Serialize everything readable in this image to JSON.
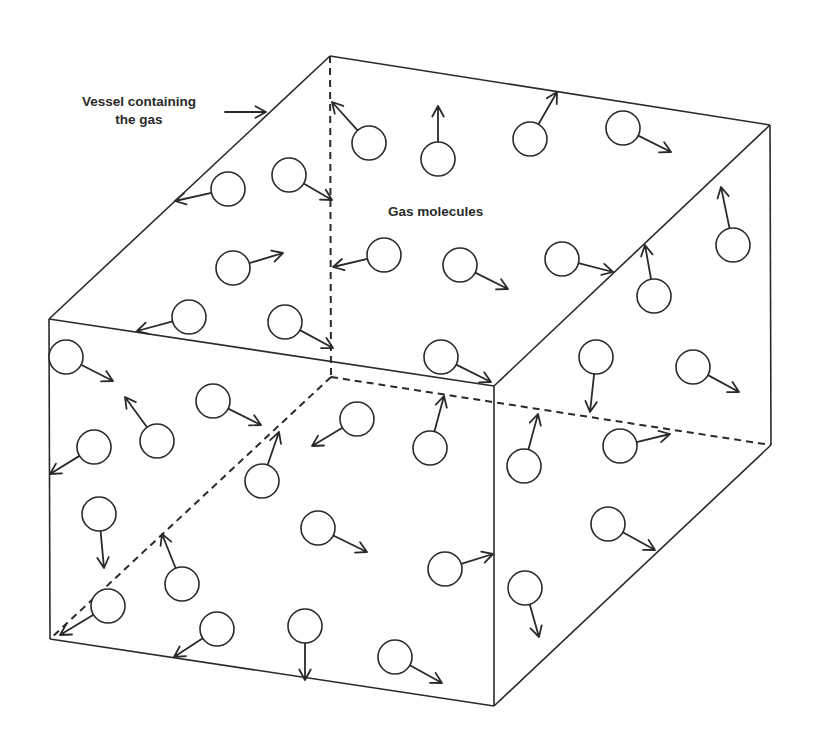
{
  "diagram": {
    "labels": {
      "vessel_line1": "Vessel containing",
      "vessel_line2": "the gas",
      "molecules": "Gas molecules"
    },
    "colors": {
      "stroke": "#2a2a2a",
      "background": "#ffffff"
    },
    "box": {
      "vertices": {
        "top_back_left": [
          330,
          56
        ],
        "top_back_right": [
          770,
          125
        ],
        "top_front_left": [
          49,
          319
        ],
        "top_front_right": [
          494,
          386
        ],
        "bottom_front_left": [
          50,
          639
        ],
        "bottom_front_right": [
          494,
          706
        ],
        "bottom_back_right": [
          771,
          445
        ],
        "bottom_back_left_hidden": [
          331,
          377
        ]
      },
      "visible_edges": [
        [
          "top_back_left",
          "top_back_right"
        ],
        [
          "top_back_left",
          "top_front_left"
        ],
        [
          "top_back_right",
          "top_front_right"
        ],
        [
          "top_front_left",
          "top_front_right"
        ],
        [
          "top_front_left",
          "bottom_front_left"
        ],
        [
          "top_front_right",
          "bottom_front_right"
        ],
        [
          "bottom_front_left",
          "bottom_front_right"
        ],
        [
          "bottom_front_right",
          "bottom_back_right"
        ],
        [
          "top_back_right",
          "bottom_back_right"
        ]
      ],
      "hidden_edges": [
        [
          "top_back_left",
          "bottom_back_left_hidden"
        ],
        [
          "bottom_back_left_hidden",
          "bottom_front_left"
        ],
        [
          "bottom_back_left_hidden",
          "bottom_back_right"
        ]
      ]
    },
    "pointer_arrow": {
      "from": [
        225,
        112
      ],
      "to": [
        266,
        112
      ]
    },
    "molecule_radius": 17,
    "molecules": [
      {
        "c": [
          369,
          143
        ],
        "tip": [
          332,
          102
        ]
      },
      {
        "c": [
          438,
          159
        ],
        "tip": [
          438,
          106
        ]
      },
      {
        "c": [
          530,
          139
        ],
        "tip": [
          557,
          92
        ]
      },
      {
        "c": [
          623,
          128
        ],
        "tip": [
          671,
          152
        ]
      },
      {
        "c": [
          228,
          189
        ],
        "tip": [
          175,
          201
        ]
      },
      {
        "c": [
          289,
          175
        ],
        "tip": [
          332,
          200
        ]
      },
      {
        "c": [
          384,
          255
        ],
        "tip": [
          333,
          267
        ]
      },
      {
        "c": [
          233,
          268
        ],
        "tip": [
          283,
          253
        ]
      },
      {
        "c": [
          460,
          265
        ],
        "tip": [
          508,
          289
        ]
      },
      {
        "c": [
          562,
          259
        ],
        "tip": [
          613,
          272
        ]
      },
      {
        "c": [
          654,
          296
        ],
        "tip": [
          645,
          245
        ]
      },
      {
        "c": [
          733,
          245
        ],
        "tip": [
          721,
          187
        ]
      },
      {
        "c": [
          189,
          317
        ],
        "tip": [
          137,
          331
        ]
      },
      {
        "c": [
          285,
          322
        ],
        "tip": [
          333,
          348
        ]
      },
      {
        "c": [
          441,
          357
        ],
        "tip": [
          491,
          382
        ]
      },
      {
        "c": [
          596,
          357
        ],
        "tip": [
          590,
          412
        ]
      },
      {
        "c": [
          693,
          367
        ],
        "tip": [
          739,
          392
        ]
      },
      {
        "c": [
          66,
          357
        ],
        "tip": [
          113,
          381
        ]
      },
      {
        "c": [
          157,
          441
        ],
        "tip": [
          125,
          397
        ]
      },
      {
        "c": [
          213,
          401
        ],
        "tip": [
          261,
          425
        ]
      },
      {
        "c": [
          94,
          447
        ],
        "tip": [
          50,
          474
        ]
      },
      {
        "c": [
          357,
          419
        ],
        "tip": [
          312,
          446
        ]
      },
      {
        "c": [
          430,
          448
        ],
        "tip": [
          444,
          396
        ]
      },
      {
        "c": [
          524,
          466
        ],
        "tip": [
          538,
          414
        ]
      },
      {
        "c": [
          620,
          446
        ],
        "tip": [
          670,
          434
        ]
      },
      {
        "c": [
          99,
          514
        ],
        "tip": [
          104,
          568
        ]
      },
      {
        "c": [
          262,
          481
        ],
        "tip": [
          279,
          432
        ]
      },
      {
        "c": [
          318,
          528
        ],
        "tip": [
          367,
          552
        ]
      },
      {
        "c": [
          182,
          584
        ],
        "tip": [
          162,
          534
        ]
      },
      {
        "c": [
          108,
          606
        ],
        "tip": [
          60,
          635
        ]
      },
      {
        "c": [
          445,
          569
        ],
        "tip": [
          493,
          554
        ]
      },
      {
        "c": [
          608,
          524
        ],
        "tip": [
          655,
          550
        ]
      },
      {
        "c": [
          525,
          588
        ],
        "tip": [
          539,
          637
        ]
      },
      {
        "c": [
          217,
          629
        ],
        "tip": [
          174,
          657
        ]
      },
      {
        "c": [
          305,
          626
        ],
        "tip": [
          305,
          680
        ]
      },
      {
        "c": [
          395,
          657
        ],
        "tip": [
          442,
          683
        ]
      }
    ]
  }
}
